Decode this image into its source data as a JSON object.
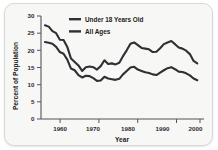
{
  "chart_data": {
    "type": "line",
    "title": "",
    "xlabel": "Year",
    "ylabel": "Percent of Population",
    "xlim": [
      1959,
      2001
    ],
    "ylim": [
      0,
      30
    ],
    "xticks": [
      "1960",
      "1970",
      "1980",
      "1990",
      "2000"
    ],
    "xtick_values": [
      1960,
      1970,
      1980,
      1990,
      2000
    ],
    "yticks": [
      "0",
      "5",
      "10",
      "15",
      "20",
      "25",
      "30"
    ],
    "ytick_values": [
      0,
      5,
      10,
      15,
      20,
      25,
      30
    ],
    "grid": false,
    "legend_position": "top-center",
    "line_color": "#2f2f34",
    "background_color": "#f7f7f5",
    "x": [
      1959,
      1960,
      1961,
      1962,
      1963,
      1964,
      1965,
      1966,
      1967,
      1968,
      1969,
      1970,
      1971,
      1972,
      1973,
      1974,
      1975,
      1976,
      1977,
      1978,
      1979,
      1980,
      1981,
      1982,
      1983,
      1984,
      1985,
      1986,
      1987,
      1988,
      1989,
      1990,
      1991,
      1992,
      1993,
      1994,
      1995,
      1996,
      1997,
      1998,
      1999,
      2000
    ],
    "series": [
      {
        "name": "Under 18 Years Old",
        "values": [
          27.3,
          26.9,
          25.6,
          25.0,
          23.1,
          23.0,
          21.0,
          17.6,
          16.6,
          15.6,
          14.0,
          15.1,
          15.3,
          15.1,
          14.4,
          15.4,
          17.1,
          16.0,
          16.2,
          15.9,
          16.4,
          18.3,
          20.0,
          21.9,
          22.3,
          21.5,
          20.7,
          20.5,
          20.3,
          19.5,
          19.6,
          20.6,
          21.8,
          22.3,
          22.7,
          21.8,
          20.8,
          20.5,
          19.9,
          18.9,
          16.9,
          16.2
        ],
        "color": "#2f2f34"
      },
      {
        "name": "All Ages",
        "values": [
          22.4,
          22.2,
          21.9,
          21.0,
          19.5,
          19.0,
          17.3,
          14.7,
          14.2,
          12.8,
          12.1,
          12.6,
          12.5,
          11.9,
          11.1,
          11.2,
          12.3,
          11.8,
          11.6,
          11.4,
          11.7,
          13.0,
          14.0,
          15.0,
          15.2,
          14.4,
          14.0,
          13.6,
          13.4,
          13.0,
          12.8,
          13.5,
          14.2,
          14.8,
          15.1,
          14.5,
          13.8,
          13.7,
          13.3,
          12.7,
          11.8,
          11.3
        ],
        "color": "#2f2f34"
      }
    ],
    "legend": [
      {
        "label": "Under 18 Years Old",
        "color": "#2f2f34"
      },
      {
        "label": "All Ages",
        "color": "#2f2f34"
      }
    ]
  }
}
